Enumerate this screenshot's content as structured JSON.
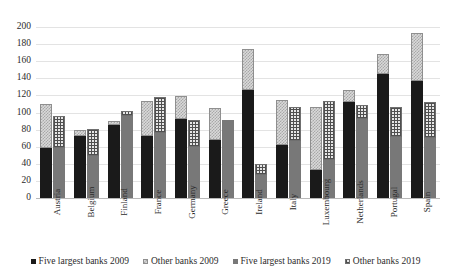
{
  "chart_data": {
    "type": "bar",
    "subtype": "grouped-stacked",
    "title": "",
    "xlabel": "",
    "ylabel": "",
    "ylim": [
      0,
      200
    ],
    "yticks": [
      0,
      20,
      40,
      60,
      80,
      100,
      120,
      140,
      160,
      180,
      200
    ],
    "grid": true,
    "legend_position": "bottom",
    "categories": [
      "Austria",
      "Belgium",
      "Finland",
      "France",
      "Germany",
      "Greece",
      "Ireland",
      "Italy",
      "Luxembourg",
      "Netherlands",
      "Portugal",
      "Spain"
    ],
    "series": [
      {
        "name": "Five largest banks 2009",
        "group": "2009",
        "stack": "bottom",
        "color": "#1a1a1a",
        "pattern": "solid",
        "values": [
          58,
          72,
          85,
          73,
          92,
          68,
          126,
          62,
          33,
          112,
          145,
          137
        ]
      },
      {
        "name": "Other banks 2009",
        "group": "2009",
        "stack": "top",
        "color": "#d9d9d9",
        "pattern": "checker",
        "values": [
          52,
          7,
          5,
          40,
          27,
          37,
          48,
          53,
          74,
          14,
          23,
          56
        ]
      },
      {
        "name": "Five largest banks 2019",
        "group": "2019",
        "stack": "bottom",
        "color": "#787878",
        "pattern": "solid",
        "values": [
          58,
          49,
          96,
          76,
          60,
          91,
          27,
          67,
          44,
          93,
          71,
          70
        ]
      },
      {
        "name": "Other banks 2019",
        "group": "2019",
        "stack": "top",
        "color": "#e6e6e6",
        "pattern": "crosshatch",
        "values": [
          38,
          32,
          6,
          42,
          31,
          0,
          13,
          40,
          70,
          16,
          36,
          42
        ]
      }
    ],
    "totals_2009": [
      110,
      79,
      90,
      113,
      119,
      105,
      174,
      115,
      107,
      126,
      168,
      193
    ],
    "totals_2019": [
      96,
      81,
      102,
      118,
      91,
      91,
      40,
      107,
      114,
      109,
      107,
      112
    ]
  },
  "legend": {
    "items": [
      {
        "label": "Five largest banks 2009",
        "swatch": "solid-black"
      },
      {
        "label": "Other banks 2009",
        "swatch": "checker-light"
      },
      {
        "label": "Five largest banks 2019",
        "swatch": "solid-gray"
      },
      {
        "label": "Other banks 2019",
        "swatch": "crosshatch"
      }
    ]
  }
}
